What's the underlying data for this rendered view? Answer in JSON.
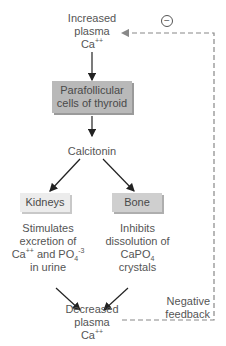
{
  "diagram": {
    "nodes": {
      "increased": {
        "line1": "Increased",
        "line2": "plasma",
        "line3": "Ca",
        "sup": "++"
      },
      "parafollicular": {
        "line1": "Parafollicular",
        "line2": "cells of thyroid"
      },
      "calcitonin": {
        "label": "Calcitonin"
      },
      "kidneys": {
        "label": "Kidneys"
      },
      "bone": {
        "label": "Bone"
      },
      "kidney_effect": {
        "line1": "Stimulates",
        "line2": "excretion of",
        "line3a": "Ca",
        "line3a_sup": "++",
        "line3b": " and PO",
        "line3b_sub": "4",
        "line3b_sup": "-3",
        "line4": "in urine"
      },
      "bone_effect": {
        "line1": "Inhibits",
        "line2": "dissolution of",
        "line3": "CaPO",
        "line3_sub": "4",
        "line4": "crystals"
      },
      "decreased": {
        "line1": "Decreased",
        "line2": "plasma",
        "line3": "Ca",
        "sup": "++"
      }
    },
    "feedback": {
      "symbol": "−",
      "line1": "Negative",
      "line2": "feedback"
    },
    "colors": {
      "text": "#555555",
      "arrow": "#222222",
      "dashed": "#888888",
      "box_dark": "#b9b9b9",
      "box_light": "#ececec"
    }
  }
}
